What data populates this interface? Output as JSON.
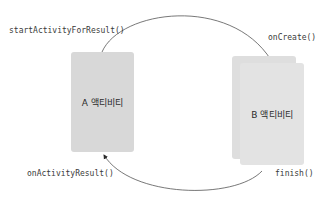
{
  "diagram": {
    "nodes": [
      {
        "id": "activity-a",
        "label": "A 액티비티"
      },
      {
        "id": "activity-b",
        "label": "B 액티비티"
      }
    ],
    "edges": [
      {
        "from": "activity-a",
        "to": "activity-b",
        "label_start": "startActivityForResult()",
        "label_end": "onCreate()"
      },
      {
        "from": "activity-b",
        "to": "activity-a",
        "label_start": "finish()",
        "label_end": "onActivityResult()"
      }
    ]
  },
  "labels": {
    "start_activity_for_result": "startActivityForResult()",
    "on_create": "onCreate()",
    "on_activity_result": "onActivityResult()",
    "finish": "finish()"
  },
  "cards": {
    "a": {
      "label": "A 액티비티"
    },
    "b": {
      "label": "B 액티비티"
    }
  },
  "colors": {
    "card_fill": "#d9d9d9",
    "line": "#555555",
    "text": "#333333",
    "background": "#ffffff"
  }
}
